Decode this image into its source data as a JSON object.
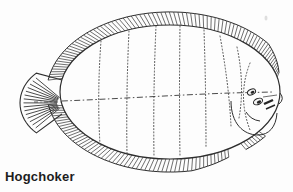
{
  "figure": {
    "caption": "Hogchoker",
    "illustration": "hogchoker-flatfish-line-drawing",
    "colors": {
      "background": "#fdfdfd",
      "line": "#2e2e2e",
      "hatch": "#4a4a4a",
      "stripe": "#4a4a4a",
      "eye_dark": "#252525",
      "caption_text": "#1d1d1d",
      "artifact": "#dedede"
    }
  }
}
